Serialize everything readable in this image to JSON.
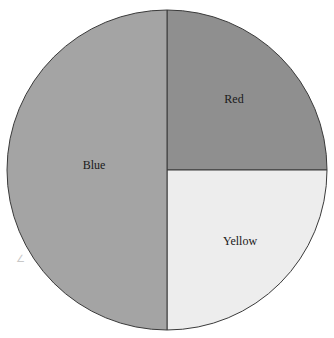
{
  "chart_data": {
    "type": "pie",
    "title": "",
    "categories": [
      "Blue",
      "Red",
      "Yellow"
    ],
    "values": [
      50,
      25,
      25
    ],
    "unit": "%",
    "start_angle_deg": 90,
    "direction": "clockwise_from_top_for_red",
    "colors": {
      "Blue": "#a4a4a4",
      "Red": "#8f8f8f",
      "Yellow": "#ededed"
    },
    "slices": [
      {
        "label": "Blue",
        "value": 50,
        "color": "#a4a4a4",
        "label_pos": [
          94,
          169
        ]
      },
      {
        "label": "Red",
        "value": 25,
        "color": "#8f8f8f",
        "label_pos": [
          234,
          103
        ]
      },
      {
        "label": "Yellow",
        "value": 25,
        "color": "#ededed",
        "label_pos": [
          240,
          245
        ]
      }
    ],
    "legend": null,
    "geometry": {
      "cx": 167,
      "cy": 170,
      "r": 160
    },
    "outline_color": "#3a3a3a"
  },
  "annotations": {
    "stray_mark": "∠"
  }
}
